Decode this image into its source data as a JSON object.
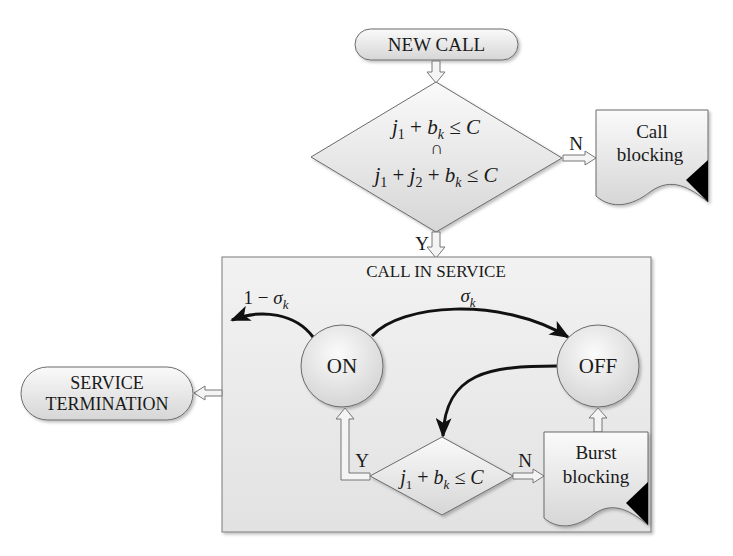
{
  "diagram": {
    "start": {
      "label": "NEW CALL"
    },
    "admission_check": {
      "line1": {
        "j": "j",
        "sub1": "1",
        "plus": " + ",
        "b": "b",
        "subk": "k",
        "rel": " ≤ C"
      },
      "intersect": "∩",
      "line2": {
        "j1": "j",
        "sub1": "1",
        "plus1": " + ",
        "j2": "j",
        "sub2": "2",
        "plus2": " + ",
        "b": "b",
        "subk": "k",
        "rel": " ≤ C"
      },
      "yes_label": "Y",
      "no_label": "N"
    },
    "call_blocking": {
      "line1": "Call",
      "line2": "blocking"
    },
    "service_box": {
      "title": "CALL IN SERVICE",
      "on_state": "ON",
      "off_state": "OFF",
      "exit_prob": {
        "prefix": "1 − ",
        "sigma": "σ",
        "sub": "k"
      },
      "on_off_prob": {
        "sigma": "σ",
        "sub": "k"
      },
      "burst_check": {
        "j": "j",
        "sub1": "1",
        "plus": " + ",
        "b": "b",
        "subk": "k",
        "rel": " ≤ C",
        "yes_label": "Y",
        "no_label": "N"
      },
      "burst_blocking": {
        "line1": "Burst",
        "line2": "blocking"
      }
    },
    "end": {
      "line1": "SERVICE",
      "line2": "TERMINATION"
    },
    "colors": {
      "shape_fill_light": "#f6f6f6",
      "shape_fill_dark": "#d9d9d9",
      "stroke": "#707070",
      "box_fill": "#ececec",
      "arrow": "#111111"
    }
  }
}
